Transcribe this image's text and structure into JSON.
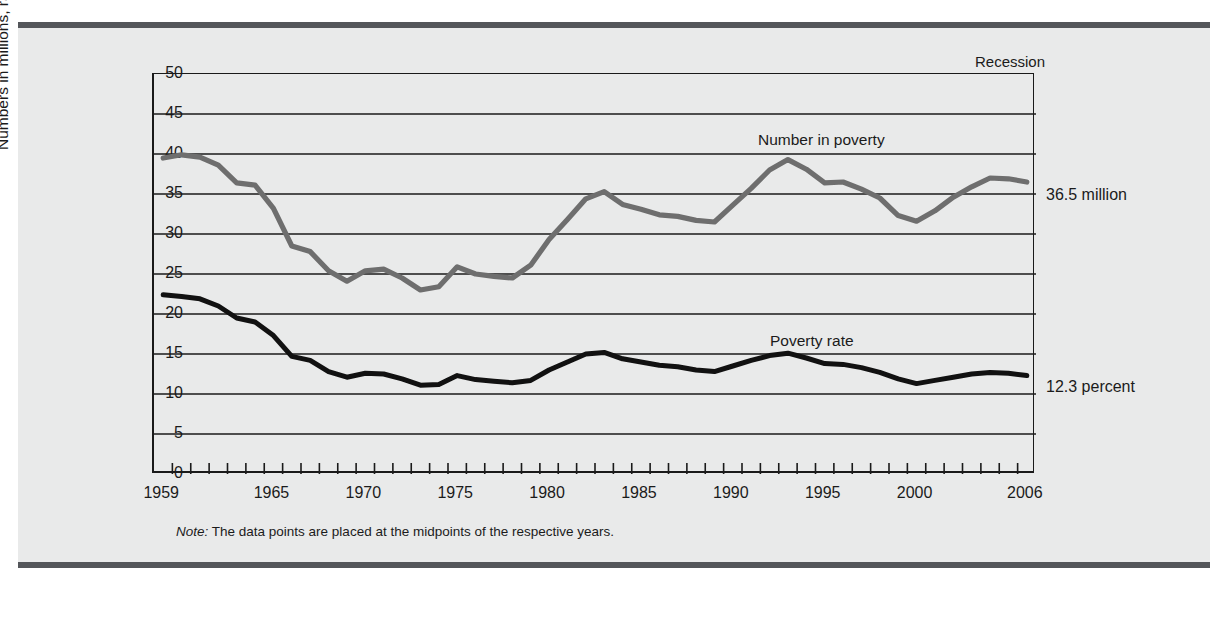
{
  "figure": {
    "note_prefix": "Note:",
    "note_text": " The data points are placed at the midpoints of the respective years.",
    "recession_label": "Recession",
    "right_label_top": "36.5 million",
    "right_label_bottom": "12.3 percent"
  },
  "chart_data": {
    "type": "line",
    "title": "",
    "xlabel": "",
    "ylabel": "Numbers in millions, rates in percent",
    "xlim": [
      1959,
      2006
    ],
    "ylim": [
      0,
      50
    ],
    "grid": true,
    "legend_position": "inline-annotation",
    "y_ticks": [
      50,
      45,
      40,
      35,
      30,
      25,
      20,
      15,
      10,
      5,
      0
    ],
    "x_tick_labels": [
      1959,
      1965,
      1970,
      1975,
      1980,
      1985,
      1990,
      1995,
      2000,
      2006
    ],
    "x": [
      1959,
      1960,
      1961,
      1962,
      1963,
      1964,
      1965,
      1966,
      1967,
      1968,
      1969,
      1970,
      1971,
      1972,
      1973,
      1974,
      1975,
      1976,
      1977,
      1978,
      1979,
      1980,
      1981,
      1982,
      1983,
      1984,
      1985,
      1986,
      1987,
      1988,
      1989,
      1990,
      1991,
      1992,
      1993,
      1994,
      1995,
      1996,
      1997,
      1998,
      1999,
      2000,
      2001,
      2002,
      2003,
      2004,
      2005,
      2006
    ],
    "series": [
      {
        "name": "Number in poverty",
        "units": "millions",
        "color": "#6e6e6e",
        "end_value": 36.5,
        "values": [
          39.5,
          39.9,
          39.6,
          38.6,
          36.4,
          36.1,
          33.2,
          28.5,
          27.8,
          25.4,
          24.1,
          25.4,
          25.6,
          24.5,
          23.0,
          23.4,
          25.9,
          25.0,
          24.7,
          24.5,
          26.1,
          29.3,
          31.8,
          34.4,
          35.3,
          33.7,
          33.1,
          32.4,
          32.2,
          31.7,
          31.5,
          33.6,
          35.7,
          38.0,
          39.3,
          38.1,
          36.4,
          36.5,
          35.6,
          34.5,
          32.3,
          31.6,
          32.9,
          34.6,
          35.9,
          37.0,
          36.9,
          36.5
        ]
      },
      {
        "name": "Poverty rate",
        "units": "percent",
        "color": "#111111",
        "end_value": 12.3,
        "values": [
          22.4,
          22.2,
          21.9,
          21.0,
          19.5,
          19.0,
          17.3,
          14.7,
          14.2,
          12.8,
          12.1,
          12.6,
          12.5,
          11.9,
          11.1,
          11.2,
          12.3,
          11.8,
          11.6,
          11.4,
          11.7,
          13.0,
          14.0,
          15.0,
          15.2,
          14.4,
          14.0,
          13.6,
          13.4,
          13.0,
          12.8,
          13.5,
          14.2,
          14.8,
          15.1,
          14.5,
          13.8,
          13.7,
          13.3,
          12.7,
          11.9,
          11.3,
          11.7,
          12.1,
          12.5,
          12.7,
          12.6,
          12.3
        ]
      }
    ]
  }
}
